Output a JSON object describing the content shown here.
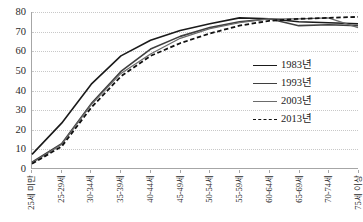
{
  "chart_data": {
    "type": "line",
    "title": "",
    "subtitle": "",
    "xlabel": "",
    "ylabel": "",
    "ylim": [
      0,
      80
    ],
    "yticks": [
      0,
      10,
      20,
      30,
      40,
      50,
      60,
      70,
      80
    ],
    "grid": true,
    "legend_position": "inside-right",
    "categories": [
      "25세 미만",
      "25-29세",
      "30-34세",
      "35-39세",
      "40-44세",
      "45-49세",
      "50-54세",
      "55-59세",
      "60-64세",
      "65-69세",
      "70-74세",
      "75세 이상"
    ],
    "series": [
      {
        "name": "1983년",
        "color": "#1a1a1a",
        "style": "solid",
        "width": 1.6,
        "values": [
          7.0,
          23.0,
          43.0,
          57.5,
          65.5,
          70.5,
          74.0,
          77.0,
          76.5,
          75.0,
          74.5,
          74.0
        ]
      },
      {
        "name": "1993년",
        "color": "#3f3f3f",
        "style": "solid",
        "width": 1.6,
        "values": [
          3.0,
          12.5,
          33.0,
          49.5,
          61.0,
          67.5,
          72.0,
          75.0,
          76.5,
          73.0,
          73.5,
          73.0
        ]
      },
      {
        "name": "2003년",
        "color": "#6b6b6b",
        "style": "solid",
        "width": 1.2,
        "values": [
          2.5,
          12.0,
          32.5,
          48.5,
          58.5,
          66.5,
          71.5,
          74.5,
          76.5,
          76.5,
          77.0,
          72.0
        ]
      },
      {
        "name": "2013년",
        "color": "#111111",
        "style": "dashed",
        "width": 1.8,
        "values": [
          2.2,
          11.0,
          31.0,
          47.0,
          57.5,
          64.0,
          69.0,
          73.0,
          75.5,
          76.5,
          77.0,
          77.5
        ]
      }
    ]
  },
  "legend": {
    "items": [
      {
        "label": "1983년"
      },
      {
        "label": "1993년"
      },
      {
        "label": "2003년"
      },
      {
        "label": "2013년"
      }
    ]
  }
}
